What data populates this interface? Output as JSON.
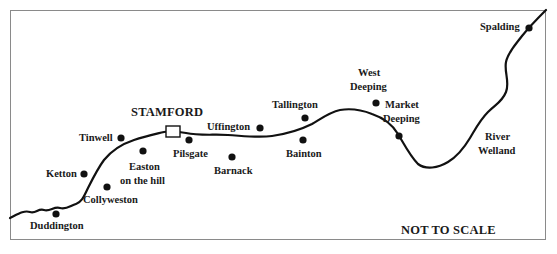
{
  "map": {
    "title_note": "NOT TO SCALE",
    "river": {
      "name_line1": "River",
      "name_line2": "Welland"
    },
    "town": {
      "name": "STAMFORD",
      "icon": "square-marker-icon"
    },
    "places": [
      {
        "key": "spalding",
        "name": "Spalding"
      },
      {
        "key": "west-deeping",
        "line1": "West",
        "line2": "Deeping"
      },
      {
        "key": "market-deeping",
        "line1": "Market",
        "line2": "Deeping"
      },
      {
        "key": "tallington",
        "name": "Tallington"
      },
      {
        "key": "bainton",
        "name": "Bainton"
      },
      {
        "key": "uffington",
        "name": "Uffington"
      },
      {
        "key": "pilsgate",
        "name": "Pilsgate"
      },
      {
        "key": "barnack",
        "name": "Barnack"
      },
      {
        "key": "tinwell",
        "name": "Tinwell"
      },
      {
        "key": "easton-on-the-hill",
        "line1": "Easton",
        "line2": "on the hill"
      },
      {
        "key": "ketton",
        "name": "Ketton"
      },
      {
        "key": "collyweston",
        "name": "Collyweston"
      },
      {
        "key": "duddington",
        "name": "Duddington"
      }
    ],
    "colors": {
      "ink": "#111111",
      "frame": "#8a8a8a",
      "background": "#ffffff"
    }
  }
}
